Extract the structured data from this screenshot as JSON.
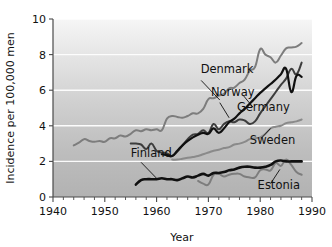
{
  "chart_data": {
    "type": "line",
    "title": "",
    "xlabel": "Year",
    "ylabel": "Incidence per 100,000 men",
    "xlim": [
      1940,
      1990
    ],
    "ylim": [
      0,
      10
    ],
    "grid": true,
    "legend_position": "inline-annotations",
    "xticks": [
      1940,
      1950,
      1960,
      1970,
      1980,
      1990
    ],
    "xtick_labels": [
      "1940",
      "1950",
      "1960",
      "1970",
      "1980",
      "1990"
    ],
    "xminor_step": 2,
    "yticks": [
      0,
      2,
      4,
      6,
      8,
      10
    ],
    "ytick_labels": [
      "0",
      "2",
      "4",
      "6",
      "8",
      "10"
    ],
    "series": [
      {
        "name": "Denmark",
        "color": "#7d7d7d",
        "width": 2.0,
        "label_x": 1968.5,
        "label_y": 6.95,
        "leader": [
          [
            1968.6,
            6.55
          ],
          [
            1972.2,
            5.45
          ]
        ],
        "x": [
          1944,
          1945,
          1946,
          1947,
          1948,
          1949,
          1950,
          1951,
          1952,
          1953,
          1954,
          1955,
          1956,
          1957,
          1958,
          1959,
          1960,
          1961,
          1962,
          1963,
          1964,
          1965,
          1966,
          1967,
          1968,
          1969,
          1970,
          1971,
          1972,
          1973,
          1974,
          1975,
          1976,
          1977,
          1978,
          1979,
          1980,
          1981,
          1982,
          1983,
          1984,
          1985,
          1986,
          1987,
          1988
        ],
        "y": [
          2.9,
          3.05,
          3.25,
          3.15,
          3.1,
          3.15,
          3.1,
          3.3,
          3.3,
          3.45,
          3.4,
          3.55,
          3.75,
          3.7,
          3.8,
          3.75,
          3.8,
          3.75,
          4.4,
          4.55,
          4.5,
          4.45,
          4.55,
          4.7,
          4.7,
          4.95,
          5.5,
          5.55,
          5.7,
          5.8,
          6.1,
          6.15,
          6.4,
          6.6,
          7.1,
          7.3,
          8.3,
          8.0,
          7.85,
          7.55,
          7.95,
          8.35,
          8.4,
          8.45,
          8.65
        ]
      },
      {
        "name": "Norway",
        "color": "#3d3d3d",
        "width": 2.0,
        "label_x": 1970.5,
        "label_y": 5.7,
        "leader": [
          [
            1972.2,
            5.3
          ],
          [
            1974.0,
            4.45
          ]
        ],
        "x": [
          1955,
          1956,
          1957,
          1958,
          1959,
          1960,
          1961,
          1962,
          1963,
          1964,
          1965,
          1966,
          1967,
          1968,
          1969,
          1970,
          1971,
          1972,
          1973,
          1974,
          1975,
          1976,
          1977,
          1978,
          1979,
          1980,
          1981,
          1982,
          1983,
          1984,
          1985,
          1986,
          1987,
          1988
        ],
        "y": [
          3.0,
          3.0,
          2.95,
          2.7,
          3.0,
          2.6,
          2.5,
          2.45,
          2.3,
          2.55,
          2.9,
          3.25,
          3.5,
          3.55,
          3.75,
          3.6,
          4.1,
          3.8,
          4.1,
          4.25,
          4.2,
          4.35,
          4.3,
          4.1,
          4.25,
          4.7,
          5.1,
          5.5,
          5.9,
          6.3,
          6.65,
          7.2,
          6.9,
          7.55
        ]
      },
      {
        "name": "Germany",
        "color": "#101010",
        "width": 2.2,
        "label_x": 1975.5,
        "label_y": 4.85,
        "leader": [
          [
            1978.6,
            5.05
          ],
          [
            1976.6,
            5.75
          ]
        ],
        "x": [
          1961,
          1962,
          1963,
          1964,
          1965,
          1966,
          1967,
          1968,
          1969,
          1970,
          1971,
          1972,
          1973,
          1974,
          1975,
          1976,
          1977,
          1978,
          1979,
          1980,
          1981,
          1982,
          1983,
          1984,
          1985,
          1986,
          1987,
          1988
        ],
        "y": [
          2.4,
          2.35,
          2.3,
          2.6,
          2.9,
          3.15,
          3.35,
          3.5,
          3.6,
          3.55,
          3.85,
          3.6,
          3.85,
          4.2,
          4.4,
          4.7,
          4.95,
          5.25,
          5.55,
          5.85,
          6.1,
          6.35,
          6.6,
          6.9,
          7.2,
          5.9,
          6.8,
          6.75
        ]
      },
      {
        "name": "Sweden",
        "color": "#8a8a8a",
        "width": 2.0,
        "label_x": 1978.0,
        "label_y": 2.95,
        "leader": [
          [
            1980.2,
            3.3
          ],
          [
            1982.0,
            3.85
          ]
        ],
        "x": [
          1963,
          1964,
          1965,
          1966,
          1967,
          1968,
          1969,
          1970,
          1971,
          1972,
          1973,
          1974,
          1975,
          1976,
          1977,
          1978,
          1979,
          1980,
          1981,
          1982,
          1983,
          1984,
          1985,
          1986,
          1987,
          1988
        ],
        "y": [
          2.1,
          2.1,
          2.15,
          2.2,
          2.25,
          2.3,
          2.4,
          2.5,
          2.6,
          2.65,
          2.75,
          2.8,
          2.95,
          3.0,
          3.1,
          3.25,
          3.3,
          3.35,
          3.55,
          3.85,
          3.95,
          4.0,
          4.15,
          4.2,
          4.25,
          4.35
        ]
      },
      {
        "name": "Finland",
        "color": "#101010",
        "width": 2.6,
        "label_x": 1955.0,
        "label_y": 2.25,
        "leader": [
          [
            1957.0,
            1.95
          ],
          [
            1960.0,
            1.05
          ]
        ],
        "x": [
          1956,
          1957,
          1958,
          1959,
          1960,
          1961,
          1962,
          1963,
          1964,
          1965,
          1966,
          1967,
          1968,
          1969,
          1970,
          1971,
          1972,
          1973,
          1974,
          1975,
          1976,
          1977,
          1978,
          1979,
          1980,
          1981,
          1982,
          1983,
          1984,
          1985,
          1986,
          1987,
          1988
        ],
        "y": [
          0.7,
          0.95,
          1.0,
          1.0,
          1.0,
          1.05,
          1.0,
          1.0,
          0.95,
          1.05,
          1.15,
          1.1,
          1.2,
          1.3,
          1.2,
          1.35,
          1.35,
          1.4,
          1.5,
          1.55,
          1.65,
          1.7,
          1.7,
          1.65,
          1.65,
          1.7,
          1.8,
          2.0,
          2.05,
          2.0,
          2.0,
          2.0,
          2.0
        ]
      },
      {
        "name": "Estonia",
        "color": "#7d7d7d",
        "width": 2.0,
        "label_x": 1979.5,
        "label_y": 0.45,
        "leader": [
          [
            1982.0,
            0.75
          ],
          [
            1983.8,
            1.55
          ]
        ],
        "x": [
          1968,
          1969,
          1970,
          1971,
          1972,
          1973,
          1974,
          1975,
          1976,
          1977,
          1978,
          1979,
          1980,
          1981,
          1982,
          1983,
          1984,
          1985,
          1986,
          1987,
          1988
        ],
        "y": [
          0.9,
          0.75,
          0.7,
          1.25,
          1.3,
          1.15,
          1.25,
          1.3,
          1.3,
          1.15,
          1.1,
          1.1,
          1.5,
          1.55,
          1.5,
          1.9,
          1.75,
          2.1,
          1.8,
          1.4,
          1.25
        ]
      }
    ]
  },
  "colors": {
    "plot_bg_top": "#f4f4f4",
    "plot_bg_bottom": "#b0b0b0",
    "gridline": "#ffffff",
    "axis": "#4a4a4a",
    "text": "#111111"
  }
}
